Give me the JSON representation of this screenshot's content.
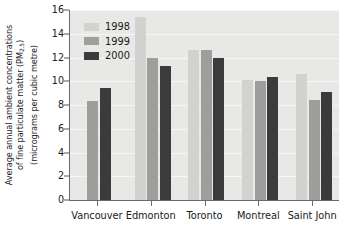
{
  "chart_data": {
    "type": "bar",
    "title": "",
    "xlabel": "",
    "ylabel": "Average annual ambient concentrations of fine particulate matter (PM2.5) (micrograms per cubic metre)",
    "ylabel_lines": [
      "Average annual ambient concentrations",
      "of fine particulate matter (PM2.5)",
      "(micrograms per cubic metre)"
    ],
    "categories": [
      "Vancouver",
      "Edmonton",
      "Toronto",
      "Montreal",
      "Saint John"
    ],
    "series": [
      {
        "name": "1998",
        "color": "#d2d2d0",
        "values": [
          null,
          15.4,
          12.6,
          10.1,
          10.6
        ]
      },
      {
        "name": "1999",
        "color": "#9e9e9c",
        "values": [
          8.3,
          12.0,
          12.6,
          10.0,
          8.4
        ]
      },
      {
        "name": "2000",
        "color": "#3b3b3b",
        "values": [
          9.4,
          11.3,
          12.0,
          10.4,
          9.1
        ]
      }
    ],
    "ylim": [
      0,
      16
    ],
    "yticks": [
      0,
      2,
      4,
      6,
      8,
      10,
      12,
      14,
      16
    ],
    "ytick_labels": [
      "0",
      "2",
      "4",
      "6",
      "8",
      "10",
      "12",
      "14",
      "16"
    ],
    "grid": true,
    "grid_axis": "y",
    "legend_position": "upper-left-inside",
    "plot_background": "#e8e8e6",
    "gridline_color": "#f6f6f4",
    "axis_color": "#6a6a6a",
    "text_color": "#1a1a1a"
  },
  "legend": {
    "entries": [
      {
        "label": "1998",
        "swatch": "#d2d2d0"
      },
      {
        "label": "1999",
        "swatch": "#9e9e9c"
      },
      {
        "label": "2000",
        "swatch": "#3b3b3b"
      }
    ]
  }
}
